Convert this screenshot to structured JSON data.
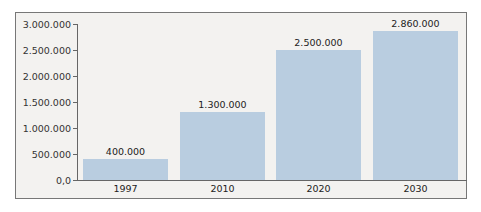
{
  "chart_data": {
    "type": "bar",
    "title": "",
    "xlabel": "",
    "ylabel": "",
    "categories": [
      "1997",
      "2010",
      "2020",
      "2030"
    ],
    "values": [
      400000,
      1300000,
      2500000,
      2860000
    ],
    "value_labels": [
      "400.000",
      "1.300.000",
      "2.500.000",
      "2.860.000"
    ],
    "ylim": [
      0,
      3000000
    ],
    "yticks": [
      "0,0",
      "500.000",
      "1.000.000",
      "1.500.000",
      "2.000.000",
      "2.500.000",
      "3.000.000"
    ],
    "grid": false,
    "legend": null,
    "bar_color": "#b9cde0",
    "background_color": "#f3f2f0"
  }
}
